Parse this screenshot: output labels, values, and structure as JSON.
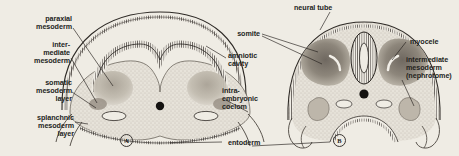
{
  "figure": {
    "caption_bg": "#efece4",
    "ink": "#231f1c",
    "panels": [
      {
        "letter": "A",
        "x": 125,
        "y": 134
      },
      {
        "letter": "B",
        "x": 338,
        "y": 134
      }
    ]
  },
  "labels": {
    "paraxial_mesoderm": "paraxial\nmesoderm",
    "intermediate_mesoderm_a": "inter-\nmediate\nmesoderm",
    "somatic_mesoderm_layer": "somatic\nmesoderm\nlayer",
    "splanchnic_mesoderm_layer": "splanchnic\nmesoderm\nlayer",
    "amniotic_cavity": "amniotic\ncavity",
    "intraembryonic_coelom": "intra-\nembryonic\ncoelom",
    "entoderm": "entoderm",
    "neural_tube": "neural tube",
    "somite": "somite",
    "myocele": "myocele",
    "intermediate_mesoderm_b": "intermediate\nmesoderm\n(nephrotome)"
  },
  "colors": {
    "background": "#efece4",
    "ink": "#231f1c",
    "stipple_light": "#d9d5cc",
    "stipple_mid": "#b9b3a8",
    "somite_dark": "#8e877c",
    "ectoderm_line": "#2e2a26",
    "notochord": "#141210"
  },
  "structures": {
    "panel_a": [
      "surface ectoderm (amnion)",
      "neural groove",
      "paraxial mesoderm mass",
      "intraembryonic coelom",
      "notochord",
      "entoderm (gut)"
    ],
    "panel_b": [
      "closed neural tube",
      "somite with myocele",
      "nephrotome",
      "notochord",
      "intraembryonic coelom",
      "entoderm"
    ]
  }
}
